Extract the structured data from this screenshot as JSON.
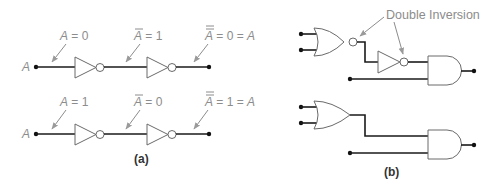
{
  "panel_a": {
    "caption": "(a)",
    "rows": [
      {
        "input_label": "A",
        "labels": [
          {
            "var": "A",
            "bars": 0,
            "rest": " = 0"
          },
          {
            "var": "A",
            "bars": 1,
            "rest": " = 1"
          },
          {
            "var": "A",
            "bars": 2,
            "rest": " = 0 = ",
            "tail": "A"
          }
        ]
      },
      {
        "input_label": "A",
        "labels": [
          {
            "var": "A",
            "bars": 0,
            "rest": " = 1"
          },
          {
            "var": "A",
            "bars": 1,
            "rest": " = 0"
          },
          {
            "var": "A",
            "bars": 2,
            "rest": " = 1 = ",
            "tail": "A"
          }
        ]
      }
    ]
  },
  "panel_b": {
    "caption": "(b)",
    "annotation": "Double Inversion",
    "top_circuit": [
      "nor-gate",
      "inverter",
      "and-gate"
    ],
    "bottom_circuit": [
      "or-gate",
      "and-gate"
    ]
  },
  "colors": {
    "wire": "#1a1a1a",
    "gate_outline": "#6a6a6a",
    "label": "#8c8c8c"
  }
}
